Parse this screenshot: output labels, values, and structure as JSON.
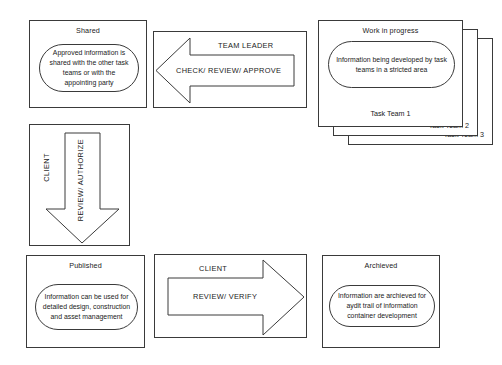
{
  "diagram": {
    "colors": {
      "background": "#ffffff",
      "stroke": "#3a3a3a",
      "text": "#1a1a1a"
    },
    "nodes": {
      "shared": {
        "title": "Shared",
        "body": "Approved information is shared with the other task teams or with the appointing party"
      },
      "work_in_progress": {
        "title": "Work in progress",
        "body": "Information being developed by task teams in a stricted area",
        "stack_labels": [
          "Task Team 1",
          "Task Team 2",
          "Task Team 3"
        ]
      },
      "published": {
        "title": "Published",
        "body": "Information can be used for detailed design, construction and asset management"
      },
      "archived": {
        "title": "Archieved",
        "body": "Information are archieved for aydit trail of information container development"
      }
    },
    "arrows": {
      "team_leader": {
        "actor": "TEAM LEADER",
        "action": "CHECK/ REVIEW/ APPROVE",
        "direction": "left"
      },
      "client_authorize": {
        "actor": "CLIENT",
        "action": "REVIEW/ AUTHORIZE",
        "direction": "down"
      },
      "client_verify": {
        "actor": "CLIENT",
        "action": "REVIEW/ VERIFY",
        "direction": "right"
      }
    }
  }
}
